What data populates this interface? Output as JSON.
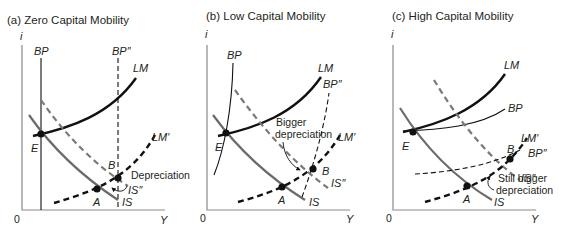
{
  "figure": {
    "panels": [
      {
        "id": "a",
        "title": "(a) Zero Capital Mobility",
        "y_axis_label": "i",
        "x_axis_label": "Y",
        "origin_label": "0",
        "curves": {
          "BP": "BP",
          "BPpp": "BP″",
          "LM": "LM",
          "LMp": "LM′",
          "IS": "IS",
          "ISpp": "IS″"
        },
        "points": {
          "E": "E",
          "A": "A",
          "B": "B"
        },
        "annotation": "Depreciation"
      },
      {
        "id": "b",
        "title": "(b) Low Capital Mobility",
        "y_axis_label": "i",
        "x_axis_label": "Y",
        "origin_label": "0",
        "curves": {
          "BP": "BP",
          "BPpp": "BP″",
          "LM": "LM",
          "LMp": "LM′",
          "IS": "IS",
          "ISpp": "IS″"
        },
        "points": {
          "E": "E",
          "A": "A",
          "B": "B"
        },
        "annotation_line1": "Bigger",
        "annotation_line2": "depreciation"
      },
      {
        "id": "c",
        "title": "(c) High Capital Mobility",
        "y_axis_label": "i",
        "x_axis_label": "Y",
        "origin_label": "0",
        "curves": {
          "BP": "BP",
          "BPpp": "BP″",
          "LM": "LM",
          "LMp": "LM′",
          "IS": "IS",
          "ISpp": "IS″"
        },
        "points": {
          "E": "E",
          "A": "A",
          "B": "B"
        },
        "annotation_line1": "Still bigger",
        "annotation_line2": "depreciation"
      }
    ],
    "colors": {
      "lm": "#111111",
      "is": "#6b6b6b",
      "is_shifted": "#7a7a7a",
      "bp": "#111111",
      "axis": "#8a8a8a",
      "text": "#231f20"
    }
  }
}
